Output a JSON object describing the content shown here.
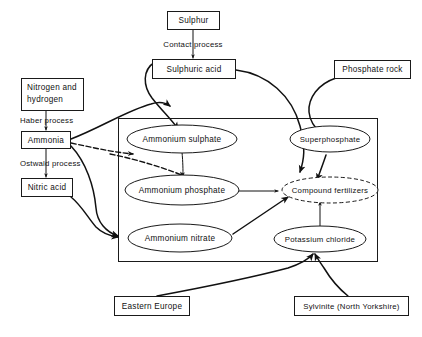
{
  "diagram": {
    "stroke_color": "#111111",
    "background_color": "#ffffff",
    "nodes": {
      "sulphur": "Sulphur",
      "sulphuric_acid": "Sulphuric  acid",
      "phosphate_rock": "Phosphate  rock",
      "nitrogen_hydrogen_line1": "Nitrogen and",
      "nitrogen_hydrogen_line2": "hydrogen",
      "ammonia": "Ammonia",
      "nitric_acid": "Nitric  acid",
      "ammonium_sulphate": "Ammonium  sulphate",
      "ammonium_phosphate": "Ammonium  phosphate",
      "ammonium_nitrate": "Ammonium  nitrate",
      "superphosphate": "Superphosphate",
      "compound_fertilizers": "Compound  fertilizers",
      "potassium_chloride": "Potassium chloride",
      "eastern_europe": "Eastern  Europe",
      "sylvinite": "Sylvinite (North Yorkshire)"
    },
    "edge_labels": {
      "contact_process": "Contact process",
      "haber_process": "Haber process",
      "ostwald_process": "Ostwald process"
    }
  }
}
